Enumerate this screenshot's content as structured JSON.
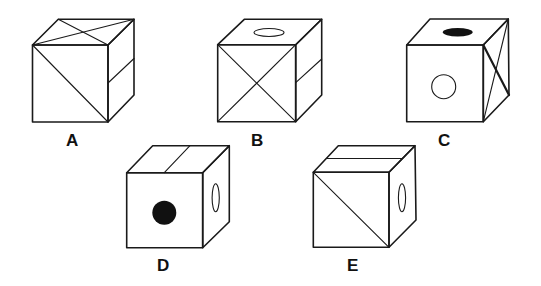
{
  "figure": {
    "type": "cube-options",
    "stroke_color": "#1a1a1a",
    "background": "#ffffff"
  },
  "cubes": [
    {
      "label": "A",
      "top": "two crossing diagonals forming X",
      "front": "single diagonal from top-left to bottom-right",
      "right": "horizontal split line across middle"
    },
    {
      "label": "B",
      "top": "hollow ellipse (circle)",
      "front": "X with both diagonals",
      "right": "horizontal split line across middle"
    },
    {
      "label": "C",
      "top": "filled black ellipse (dot)",
      "front": "hollow circle",
      "right": "X with both diagonals"
    },
    {
      "label": "D",
      "top": "vertical split line dividing face in two",
      "front": "filled black circle (dot)",
      "right": "hollow ellipse (circle)"
    },
    {
      "label": "E",
      "top": "horizontal split line dividing face in two",
      "front": "single diagonal from top-left to bottom-right",
      "right": "hollow ellipse (circle)"
    }
  ]
}
